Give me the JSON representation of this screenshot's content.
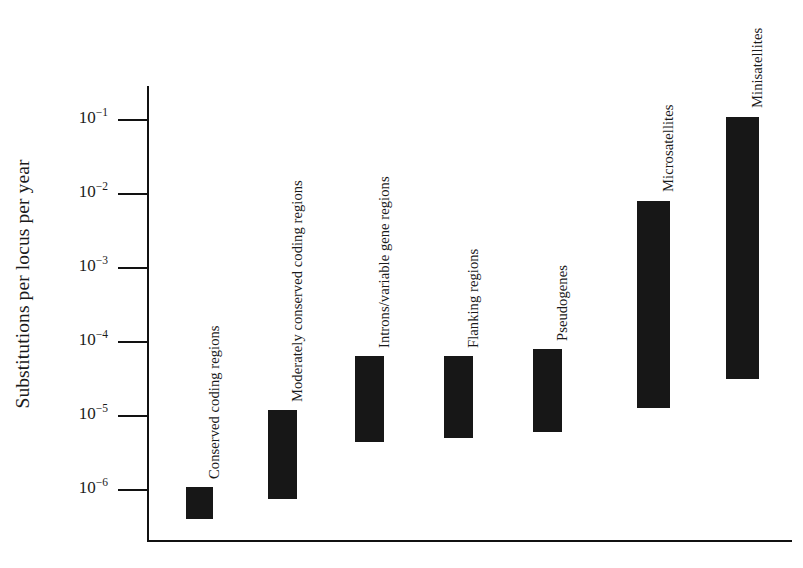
{
  "chart_data": {
    "type": "bar",
    "chart_subtype": "floating-range-bar",
    "title": "",
    "xlabel": "",
    "ylabel": "Substitutions per locus per year",
    "yscale": "log",
    "ylim": [
      3e-07,
      0.2
    ],
    "grid": false,
    "legend": null,
    "ytick_labels": [
      "10−1",
      "10−2",
      "10−3",
      "10−4",
      "10−5",
      "10−6"
    ],
    "ytick_values": [
      0.1,
      0.01,
      0.001,
      0.0001,
      1e-05,
      1e-06
    ],
    "ytick_mantissa": [
      "10",
      "10",
      "10",
      "10",
      "10",
      "10"
    ],
    "ytick_exponents": [
      "−1",
      "−2",
      "−3",
      "−4",
      "−5",
      "−6"
    ],
    "categories": [
      "Conserved coding regions",
      "Moderately conserved coding regions",
      "Introns/variable gene regions",
      "Flanking regions",
      "Pseudogenes",
      "Microsatellites",
      "Minisatellites"
    ],
    "ranges": [
      {
        "label": "Conserved coding regions",
        "low": 4e-07,
        "high": 1.1e-06
      },
      {
        "label": "Moderately conserved coding regions",
        "low": 7.5e-07,
        "high": 1.2e-05
      },
      {
        "label": "Introns/variable gene regions",
        "low": 4.5e-06,
        "high": 6.5e-05
      },
      {
        "label": "Flanking regions",
        "low": 5e-06,
        "high": 6.5e-05
      },
      {
        "label": "Pseudogenes",
        "low": 6e-06,
        "high": 8e-05
      },
      {
        "label": "Microsatellites",
        "low": 1.3e-05,
        "high": 0.008
      },
      {
        "label": "Minisatellites",
        "low": 3.2e-05,
        "high": 0.11
      }
    ],
    "bar_color": "#171717",
    "axis_color": "#111111"
  }
}
